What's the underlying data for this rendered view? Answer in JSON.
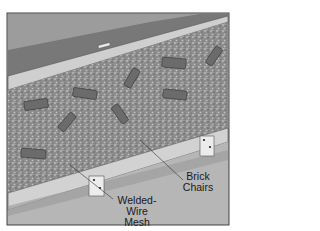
{
  "diagram": {
    "labels": {
      "brick_chairs_line1": "Brick",
      "brick_chairs_line2": "Chairs",
      "mesh_line1": "Welded-",
      "mesh_line2": "Wire Mesh"
    },
    "colors": {
      "background": "#ffffff",
      "frame": "#444444",
      "sky_grass": "#9a9a9a",
      "grass_dark": "#6e6e6e",
      "form_board": "#cfcfcf",
      "gravel": "#8c8c8c",
      "brick": "#6a6a6a",
      "ground": "#b4b4b4"
    }
  }
}
